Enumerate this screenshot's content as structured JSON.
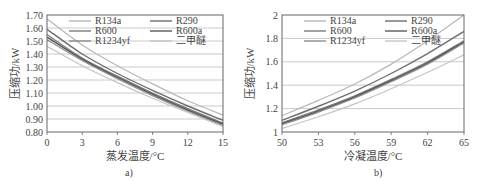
{
  "chart_data": [
    {
      "id": "a",
      "type": "line",
      "caption": "a)",
      "xlabel": "蒸发温度/°C",
      "ylabel": "压缩功/kW",
      "xlim": [
        0,
        15
      ],
      "ylim": [
        0.8,
        1.7
      ],
      "xticks": [
        "0",
        "3",
        "6",
        "9",
        "12",
        "15"
      ],
      "yticks": [
        "0.80",
        "0.90",
        "1.00",
        "1.10",
        "1.20",
        "1.30",
        "1.40",
        "1.50",
        "1.60",
        "1.70"
      ],
      "grid": "horizontal",
      "legend": [
        "R134a",
        "R290",
        "R600",
        "R600a",
        "R1234yf",
        "二甲醚"
      ],
      "legend_position": "top inside, two columns",
      "curve_labeling_note": "Legend swatches are near-identical greys; curves are listed by vertical rank (top to bottom at x=0), not matched to refrigerant names. All values are estimates read from gridlines.",
      "x": [
        0,
        3,
        6,
        9,
        12,
        15
      ],
      "series": [
        {
          "rank": 1,
          "values": [
            1.67,
            1.47,
            1.31,
            1.17,
            1.04,
            0.93
          ]
        },
        {
          "rank": 2,
          "values": [
            1.59,
            1.4,
            1.25,
            1.12,
            1.0,
            0.89
          ]
        },
        {
          "rank": 3,
          "values": [
            1.55,
            1.37,
            1.23,
            1.1,
            0.98,
            0.87
          ]
        },
        {
          "rank": 4,
          "values": [
            1.53,
            1.36,
            1.22,
            1.09,
            0.97,
            0.86
          ]
        },
        {
          "rank": 5,
          "values": [
            1.51,
            1.35,
            1.21,
            1.08,
            0.96,
            0.85
          ]
        },
        {
          "rank": 6,
          "values": [
            1.46,
            1.31,
            1.18,
            1.06,
            0.95,
            0.84
          ]
        }
      ]
    },
    {
      "id": "b",
      "type": "line",
      "caption": "b)",
      "xlabel": "冷凝温度/°C",
      "ylabel": "压缩功/kW",
      "xlim": [
        50,
        65
      ],
      "ylim": [
        1,
        2
      ],
      "xticks": [
        "50",
        "53",
        "56",
        "59",
        "62",
        "65"
      ],
      "yticks": [
        "1",
        "1.2",
        "1.4",
        "1.6",
        "1.8",
        "2"
      ],
      "grid": "horizontal",
      "legend": [
        "R134a",
        "R290",
        "R600",
        "R600a",
        "R1234yf",
        "二甲醚"
      ],
      "legend_position": "top inside, two columns",
      "curve_labeling_note": "Legend swatches are near-identical greys; curves are listed by vertical rank (top to bottom at x=65), not matched to refrigerant names. All values are estimates read from gridlines.",
      "x": [
        50,
        53,
        56,
        59,
        62,
        65
      ],
      "series": [
        {
          "rank": 1,
          "values": [
            1.14,
            1.27,
            1.41,
            1.58,
            1.78,
            2.0
          ]
        },
        {
          "rank": 2,
          "values": [
            1.1,
            1.22,
            1.35,
            1.5,
            1.67,
            1.86
          ]
        },
        {
          "rank": 3,
          "values": [
            1.08,
            1.19,
            1.31,
            1.45,
            1.6,
            1.78
          ]
        },
        {
          "rank": 4,
          "values": [
            1.07,
            1.18,
            1.3,
            1.44,
            1.59,
            1.77
          ]
        },
        {
          "rank": 5,
          "values": [
            1.06,
            1.17,
            1.29,
            1.43,
            1.58,
            1.76
          ]
        },
        {
          "rank": 6,
          "values": [
            1.03,
            1.13,
            1.24,
            1.37,
            1.51,
            1.66
          ]
        }
      ]
    }
  ],
  "style": {
    "line_colors": [
      "#b8b8b8",
      "#6e6e6e",
      "#7a7a7a",
      "#5a5a5a",
      "#8c8c8c",
      "#c4c4c4"
    ],
    "line_widths": [
      1.2,
      1.4,
      1.2,
      1.6,
      1.2,
      1.2
    ],
    "grid_color": "#bdbdbd",
    "axis_color": "#666666"
  }
}
